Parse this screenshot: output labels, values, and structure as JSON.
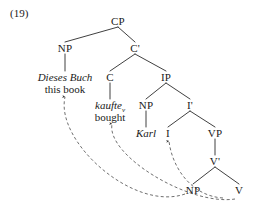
{
  "figure": {
    "example_number": "(19)",
    "language": "German",
    "ink_color": "#1a1a1a",
    "dash_color": "#4a4a4a"
  },
  "tree": {
    "nodes": [
      {
        "id": "CP",
        "label": "CP",
        "x": 118,
        "y": 21
      },
      {
        "id": "NP1",
        "label": "NP",
        "x": 65,
        "y": 48
      },
      {
        "id": "Cbar",
        "label": "C'",
        "x": 135,
        "y": 48
      },
      {
        "id": "C",
        "label": "C",
        "x": 110,
        "y": 77
      },
      {
        "id": "IP",
        "label": "IP",
        "x": 166,
        "y": 77
      },
      {
        "id": "NP2",
        "label": "NP",
        "x": 146,
        "y": 105
      },
      {
        "id": "Ibar",
        "label": "I'",
        "x": 190,
        "y": 105
      },
      {
        "id": "I",
        "label": "I",
        "x": 168,
        "y": 133
      },
      {
        "id": "VP",
        "label": "VP",
        "x": 215,
        "y": 133
      },
      {
        "id": "Vbar",
        "label": "V'",
        "x": 215,
        "y": 161
      },
      {
        "id": "NP3",
        "label": "NP",
        "x": 193,
        "y": 190
      },
      {
        "id": "V",
        "label": "V",
        "x": 239,
        "y": 190
      }
    ],
    "terminals": [
      {
        "id": "dieses-buch",
        "source": "Dieses Buch",
        "gloss": "this book",
        "x": 65,
        "y_source": 77,
        "y_gloss": 89
      },
      {
        "id": "kaufte",
        "source": "kaufte",
        "source_subscript": "v",
        "gloss": "bought",
        "x": 110,
        "y_source": 105,
        "y_gloss": 117
      },
      {
        "id": "karl",
        "source": "Karl",
        "gloss": "",
        "x": 146,
        "y_source": 133,
        "y_gloss": null
      }
    ],
    "branches": [
      {
        "from": "CP",
        "to": "NP1"
      },
      {
        "from": "CP",
        "to": "Cbar"
      },
      {
        "from": "Cbar",
        "to": "C"
      },
      {
        "from": "Cbar",
        "to": "IP"
      },
      {
        "from": "IP",
        "to": "NP2"
      },
      {
        "from": "IP",
        "to": "Ibar"
      },
      {
        "from": "Ibar",
        "to": "I"
      },
      {
        "from": "Ibar",
        "to": "VP"
      },
      {
        "from": "VP",
        "to": "Vbar"
      },
      {
        "from": "Vbar",
        "to": "NP3"
      },
      {
        "from": "Vbar",
        "to": "V"
      }
    ],
    "stems": [
      {
        "from": "NP1",
        "to": "dieses-buch"
      },
      {
        "from": "C",
        "to": "kaufte"
      },
      {
        "from": "NP2",
        "to": "karl"
      }
    ],
    "movement_arcs": [
      {
        "id": "object-movement",
        "from": "NP3",
        "to": "dieses-buch",
        "description": "object NP raises to Spec,CP"
      },
      {
        "id": "verb-movement",
        "from": "V",
        "to": "kaufte",
        "description": "verb raises through I to C"
      },
      {
        "id": "head-movement",
        "from": "V",
        "to": "I",
        "description": "V raises to I"
      }
    ]
  }
}
